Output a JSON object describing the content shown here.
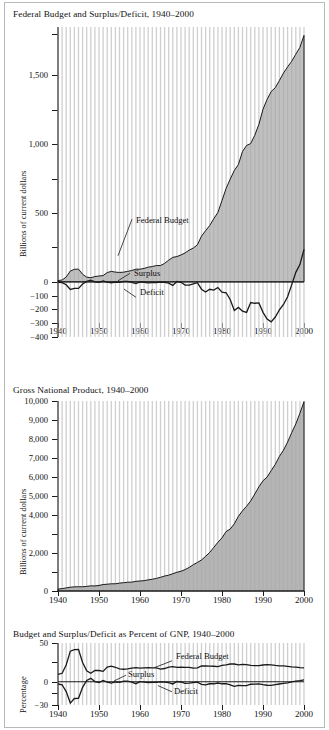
{
  "figure": {
    "name": "federal-budget-gnp-figure"
  },
  "charts": [
    {
      "id": "chart-federal-budget",
      "title": "Federal Budget and Surplus/Deficit, 1940–2000",
      "ylabel": "Billions of current dollars",
      "yticks_labeled": [
        "1,500",
        "1,000",
        "500",
        "0",
        "−100",
        "−200",
        "−300",
        "−400"
      ],
      "xticks": [
        "1940",
        "1950",
        "1960",
        "1970",
        "1980",
        "1990",
        "2000"
      ],
      "annotations": [
        "Federal Budget",
        "Surplus",
        "Deficit"
      ]
    },
    {
      "id": "chart-gnp",
      "title": "Gross National Product, 1940–2000",
      "ylabel": "Billions of current dollars",
      "yticks_labeled": [
        "10,000",
        "9,000",
        "8,000",
        "7,000",
        "6,000",
        "5,000",
        "4,000",
        "2,000",
        "0"
      ],
      "xticks": [
        "1940",
        "1950",
        "1960",
        "1970",
        "1980",
        "1990",
        "2000"
      ],
      "annotations": []
    },
    {
      "id": "chart-percent-gnp",
      "title": "Budget and Surplus/Deficit as Percent of GNP, 1940–2000",
      "ylabel": "Percentage",
      "yticks_labeled": [
        "50",
        "0",
        "−30"
      ],
      "xticks": [
        "1940",
        "1950",
        "1960",
        "1970",
        "1980",
        "1990",
        "2000"
      ],
      "annotations": [
        "Federal Budget",
        "Surplus",
        "Deficit"
      ]
    }
  ],
  "colors": {
    "area_fill": "#a8a8a8",
    "gridline": "#cfcfcf",
    "axis": "#1a1a1a",
    "border": "#b9b9b9"
  },
  "chart_data": [
    {
      "type": "area",
      "title": "Federal Budget and Surplus/Deficit, 1940–2000",
      "xlabel": "",
      "ylabel": "Billions of current dollars",
      "xlim": [
        1940,
        2000
      ],
      "ylim": [
        -400,
        1850
      ],
      "grid": "vertical-annual",
      "legend": "inline-annotations",
      "x": [
        1940,
        1941,
        1942,
        1943,
        1944,
        1945,
        1946,
        1947,
        1948,
        1949,
        1950,
        1951,
        1952,
        1953,
        1954,
        1955,
        1956,
        1957,
        1958,
        1959,
        1960,
        1961,
        1962,
        1963,
        1964,
        1965,
        1966,
        1967,
        1968,
        1969,
        1970,
        1971,
        1972,
        1973,
        1974,
        1975,
        1976,
        1977,
        1978,
        1979,
        1980,
        1981,
        1982,
        1983,
        1984,
        1985,
        1986,
        1987,
        1988,
        1989,
        1990,
        1991,
        1992,
        1993,
        1994,
        1995,
        1996,
        1997,
        1998,
        1999,
        2000
      ],
      "series": [
        {
          "name": "Federal Budget",
          "values": [
            9.5,
            13.7,
            35.1,
            78.6,
            91.3,
            92.7,
            55.2,
            34.5,
            29.8,
            38.8,
            42.6,
            45.5,
            67.7,
            76.1,
            70.9,
            68.4,
            70.6,
            76.6,
            82.4,
            92.1,
            92.2,
            97.7,
            106.8,
            111.3,
            118.5,
            118.2,
            134.5,
            157.5,
            178.1,
            183.6,
            195.6,
            210.2,
            230.7,
            245.7,
            269.4,
            332.3,
            371.8,
            409.2,
            458.7,
            504.0,
            590.9,
            678.2,
            745.7,
            808.4,
            851.8,
            946.4,
            990.3,
            1004.0,
            1064.4,
            1143.7,
            1253.2,
            1324.4,
            1381.7,
            1409.4,
            1461.7,
            1515.7,
            1560.5,
            1601.2,
            1652.5,
            1701.9,
            1789.0
          ]
        },
        {
          "name": "Surplus/Deficit",
          "values": [
            -2.9,
            -4.9,
            -20.5,
            -54.6,
            -47.6,
            -47.6,
            -15.9,
            4.0,
            11.8,
            0.6,
            -3.1,
            6.1,
            -1.5,
            -6.5,
            -1.2,
            -3.0,
            3.9,
            3.4,
            -2.8,
            -12.8,
            0.3,
            -3.3,
            -7.1,
            -4.8,
            -5.9,
            -1.4,
            -3.7,
            -8.6,
            -25.2,
            3.2,
            -2.8,
            -23.0,
            -23.4,
            -14.9,
            -6.1,
            -53.2,
            -73.7,
            -53.7,
            -59.2,
            -40.7,
            -73.8,
            -79.0,
            -128.0,
            -207.8,
            -185.4,
            -212.3,
            -221.2,
            -149.7,
            -155.2,
            -152.5,
            -221.0,
            -269.2,
            -290.3,
            -255.1,
            -203.2,
            -164.0,
            -107.4,
            -21.9,
            69.3,
            125.6,
            236.2
          ]
        }
      ]
    },
    {
      "type": "area",
      "title": "Gross National Product, 1940–2000",
      "xlabel": "",
      "ylabel": "Billions of current dollars",
      "xlim": [
        1940,
        2000
      ],
      "ylim": [
        0,
        10000
      ],
      "grid": "vertical-annual",
      "legend": "none",
      "x": [
        1940,
        1941,
        1942,
        1943,
        1944,
        1945,
        1946,
        1947,
        1948,
        1949,
        1950,
        1951,
        1952,
        1953,
        1954,
        1955,
        1956,
        1957,
        1958,
        1959,
        1960,
        1961,
        1962,
        1963,
        1964,
        1965,
        1966,
        1967,
        1968,
        1969,
        1970,
        1971,
        1972,
        1973,
        1974,
        1975,
        1976,
        1977,
        1978,
        1979,
        1980,
        1981,
        1982,
        1983,
        1984,
        1985,
        1986,
        1987,
        1988,
        1989,
        1990,
        1991,
        1992,
        1993,
        1994,
        1995,
        1996,
        1997,
        1998,
        1999,
        2000
      ],
      "series": [
        {
          "name": "Gross National Product",
          "values": [
            101,
            126,
            162,
            199,
            220,
            223,
            222,
            244,
            270,
            267,
            294,
            339,
            358,
            379,
            380,
            415,
            438,
            461,
            467,
            507,
            527,
            545,
            586,
            618,
            664,
            720,
            788,
            833,
            910,
            985,
            1039,
            1128,
            1241,
            1386,
            1501,
            1635,
            1824,
            2031,
            2295,
            2566,
            2796,
            3131,
            3259,
            3535,
            3933,
            4220,
            4463,
            4740,
            5104,
            5484,
            5803,
            5996,
            6338,
            6667,
            7085,
            7415,
            7839,
            8332,
            8794,
            9354,
            9963
          ]
        }
      ]
    },
    {
      "type": "line",
      "title": "Budget and Surplus/Deficit as Percent of GNP, 1940–2000",
      "xlabel": "",
      "ylabel": "Percentage",
      "xlim": [
        1940,
        2000
      ],
      "ylim": [
        -30,
        50
      ],
      "grid": "vertical-annual",
      "legend": "inline-annotations",
      "x": [
        1940,
        1941,
        1942,
        1943,
        1944,
        1945,
        1946,
        1947,
        1948,
        1949,
        1950,
        1951,
        1952,
        1953,
        1954,
        1955,
        1956,
        1957,
        1958,
        1959,
        1960,
        1961,
        1962,
        1963,
        1964,
        1965,
        1966,
        1967,
        1968,
        1969,
        1970,
        1971,
        1972,
        1973,
        1974,
        1975,
        1976,
        1977,
        1978,
        1979,
        1980,
        1981,
        1982,
        1983,
        1984,
        1985,
        1986,
        1987,
        1988,
        1989,
        1990,
        1991,
        1992,
        1993,
        1994,
        1995,
        1996,
        1997,
        1998,
        1999,
        2000
      ],
      "series": [
        {
          "name": "Federal Budget",
          "values": [
            9.4,
            10.9,
            21.7,
            39.5,
            41.5,
            41.6,
            24.9,
            14.1,
            11.0,
            14.5,
            14.5,
            13.4,
            18.9,
            20.1,
            18.7,
            16.5,
            16.1,
            16.6,
            17.6,
            18.2,
            17.5,
            17.9,
            18.2,
            18.0,
            17.8,
            16.4,
            17.1,
            18.9,
            19.6,
            18.6,
            18.8,
            18.6,
            18.6,
            17.7,
            17.9,
            20.3,
            20.4,
            20.2,
            20.0,
            19.6,
            21.1,
            21.7,
            22.9,
            22.9,
            21.7,
            22.4,
            22.2,
            21.2,
            20.9,
            20.9,
            21.6,
            22.1,
            21.8,
            21.1,
            20.6,
            20.4,
            19.9,
            19.2,
            18.8,
            18.2,
            18.0
          ]
        },
        {
          "name": "Surplus/Deficit",
          "values": [
            -2.9,
            -3.9,
            -12.7,
            -27.5,
            -21.6,
            -21.3,
            -7.2,
            1.6,
            4.4,
            0.2,
            -1.1,
            1.8,
            -0.4,
            -1.7,
            -0.3,
            -0.7,
            0.9,
            0.7,
            -0.6,
            -2.5,
            0.1,
            -0.6,
            -1.2,
            -0.8,
            -0.9,
            -0.2,
            -0.5,
            -1.0,
            -2.8,
            0.3,
            -0.3,
            -2.0,
            -1.9,
            -1.1,
            -0.4,
            -3.3,
            -4.0,
            -2.6,
            -2.6,
            -1.6,
            -2.6,
            -2.5,
            -3.9,
            -5.9,
            -4.7,
            -5.0,
            -5.0,
            -3.2,
            -3.0,
            -2.8,
            -3.8,
            -4.5,
            -4.6,
            -3.8,
            -2.9,
            -2.2,
            -1.4,
            -0.3,
            0.8,
            1.4,
            2.4
          ]
        }
      ]
    }
  ]
}
